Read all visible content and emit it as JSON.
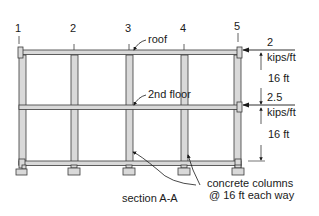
{
  "grid_labels": [
    "1",
    "2",
    "3",
    "4",
    "5"
  ],
  "callouts": {
    "roof": "roof",
    "second_floor": "2nd floor",
    "section": "section A-A",
    "columns_line1": "concrete columns",
    "columns_line2": "@ 16 ft each way"
  },
  "loads": {
    "roof_value": "2",
    "roof_unit": "kips/ft",
    "floor_value": "2.5",
    "floor_unit": "kips/ft"
  },
  "dimensions": {
    "upper_story": "16 ft",
    "lower_story": "16 ft"
  },
  "colors": {
    "member_fill": "#d9d9d9",
    "outline": "#3a3a3a"
  }
}
